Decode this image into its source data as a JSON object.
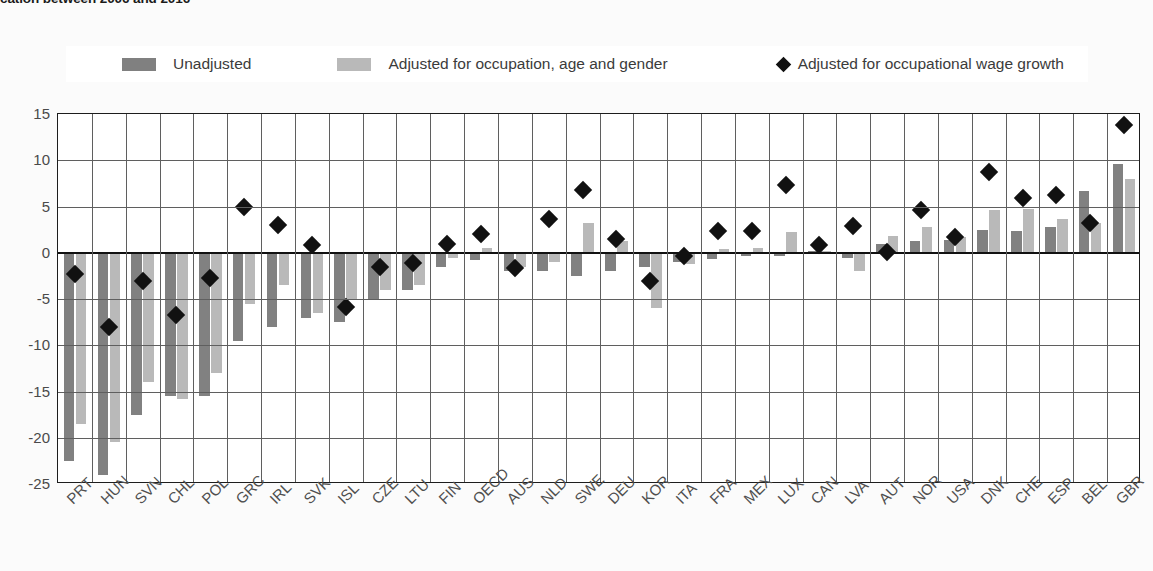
{
  "title_clipped": "cation between 2006 and 2016",
  "legend": {
    "items": [
      {
        "label": "Unadjusted",
        "marker": "square",
        "color": "#808080"
      },
      {
        "label": "Adjusted for occupation, age and gender",
        "marker": "square",
        "color": "#b9b9b9"
      },
      {
        "label": "Adjusted for occupational wage growth",
        "marker": "diamond",
        "color": "#111111"
      }
    ]
  },
  "chart_data": {
    "type": "bar",
    "title": "",
    "xlabel": "",
    "ylabel": "",
    "ylim": [
      -25,
      15
    ],
    "yticks": [
      15,
      10,
      5,
      0,
      -5,
      -10,
      -15,
      -20,
      -25
    ],
    "grid": true,
    "legend_position": "top",
    "categories": [
      "PRT",
      "HUN",
      "SVN",
      "CHL",
      "POL",
      "GRC",
      "IRL",
      "SVK",
      "ISL",
      "CZE",
      "LTU",
      "FIN",
      "OECD",
      "AUS",
      "NLD",
      "SWE",
      "DEU",
      "KOR",
      "ITA",
      "FRA",
      "MEX",
      "LUX",
      "CAN",
      "LVA",
      "AUT",
      "NOR",
      "USA",
      "DNK",
      "CHE",
      "ESP",
      "BEL",
      "GBR"
    ],
    "series": [
      {
        "name": "Unadjusted",
        "type": "bar",
        "color": "#818181",
        "values": [
          -22.5,
          -24.0,
          -17.5,
          -15.5,
          -15.5,
          -9.5,
          -8.0,
          -7.0,
          -7.5,
          -5.0,
          -4.0,
          -1.5,
          -0.8,
          -2.0,
          -2.0,
          -2.5,
          -2.0,
          -1.5,
          -1.0,
          -0.7,
          -0.4,
          -0.3,
          0.2,
          -0.6,
          1.0,
          1.3,
          1.4,
          2.5,
          2.3,
          2.8,
          6.7,
          9.6
        ]
      },
      {
        "name": "Adjusted for occupation, age and gender",
        "type": "bar",
        "color": "#b9b9b9",
        "values": [
          -18.5,
          -20.5,
          -14.0,
          -15.8,
          -13.0,
          -5.5,
          -3.5,
          -6.5,
          -5.0,
          -4.0,
          -3.5,
          -0.6,
          0.5,
          -1.5,
          -1.0,
          3.2,
          1.3,
          -6.0,
          -1.2,
          0.4,
          0.5,
          2.2,
          0.2,
          -2.0,
          1.8,
          2.8,
          1.7,
          4.6,
          4.7,
          3.6,
          3.2,
          8.0
        ]
      },
      {
        "name": "Adjusted for occupational wage growth",
        "type": "scatter",
        "marker": "diamond",
        "color": "#111111",
        "values": [
          -2.3,
          -8.0,
          -3.0,
          -6.7,
          -2.7,
          5.0,
          3.0,
          0.8,
          -5.9,
          -1.5,
          -1.1,
          0.9,
          2.0,
          -1.7,
          3.7,
          6.8,
          1.5,
          -3.0,
          -0.3,
          2.4,
          2.3,
          7.3,
          0.8,
          2.9,
          0.1,
          4.6,
          1.7,
          8.7,
          5.9,
          6.2,
          3.2,
          13.8
        ]
      }
    ]
  }
}
